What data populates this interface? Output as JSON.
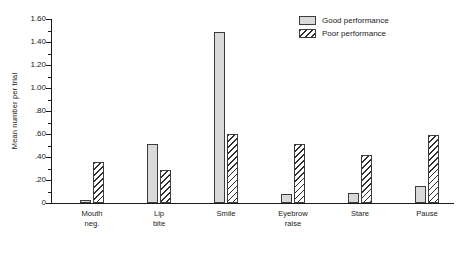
{
  "chart_data": {
    "type": "bar",
    "title": "",
    "subtitle": "",
    "xlabel": "",
    "ylabel": "Mean number per trial",
    "ylim": [
      0,
      1.6
    ],
    "ytick_values": [
      0,
      0.2,
      0.4,
      0.6,
      0.8,
      1.0,
      1.2,
      1.4,
      1.6
    ],
    "ytick_labels": [
      "0",
      ".20",
      ".40",
      ".60",
      ".80",
      "1.00",
      "1.20",
      "1.40",
      "1.60"
    ],
    "ytick_minor_values": [
      0.1,
      0.3,
      0.5,
      0.7,
      0.9,
      1.1,
      1.3,
      1.5
    ],
    "grid": false,
    "legend_position": "top-right",
    "categories": [
      "Mouth neg.",
      "Lip bite",
      "Smile",
      "Eyebrow raise",
      "Stare",
      "Pause"
    ],
    "category_lines": [
      [
        "Mouth",
        "neg."
      ],
      [
        "Lip",
        "bite"
      ],
      [
        "Smile",
        ""
      ],
      [
        "Eyebrow",
        "raise"
      ],
      [
        "Stare",
        ""
      ],
      [
        "Pause",
        ""
      ]
    ],
    "series": [
      {
        "name": "Good performance",
        "fill": "stipple",
        "values": [
          0.03,
          0.51,
          1.49,
          0.08,
          0.09,
          0.15
        ]
      },
      {
        "name": "Poor performance",
        "fill": "diagonal-hatch",
        "values": [
          0.36,
          0.29,
          0.6,
          0.51,
          0.42,
          0.59
        ]
      }
    ]
  },
  "legend": {
    "items": [
      {
        "label": "Good performance",
        "fill": "stipple"
      },
      {
        "label": "Poor performance",
        "fill": "diagonal-hatch"
      }
    ]
  },
  "colors": {
    "axis": "#1a1a1a",
    "text": "#1a1a1a",
    "good_fill": "#d9d9d9",
    "good_dot": "#7a7a7a",
    "poor_line": "#2e2e2e",
    "bar_border": "#3d3d3d",
    "background": "#ffffff"
  }
}
